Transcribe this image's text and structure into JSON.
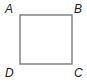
{
  "diagram": {
    "shape": "square",
    "stroke_color": "#707070",
    "vertices": {
      "A": {
        "label": "A",
        "position": "top-left"
      },
      "B": {
        "label": "B",
        "position": "top-right"
      },
      "C": {
        "label": "C",
        "position": "bottom-right"
      },
      "D": {
        "label": "D",
        "position": "bottom-left"
      }
    }
  }
}
